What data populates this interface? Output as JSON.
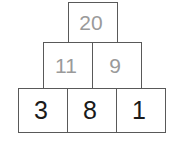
{
  "figure": {
    "kind": "number-pyramid",
    "rows": [
      {
        "row_index": 0,
        "cells": [
          {
            "value": "20",
            "style": "derived"
          }
        ]
      },
      {
        "row_index": 1,
        "cells": [
          {
            "value": "11",
            "style": "derived"
          },
          {
            "value": "9",
            "style": "derived"
          }
        ]
      },
      {
        "row_index": 2,
        "cells": [
          {
            "value": "3",
            "style": "given"
          },
          {
            "value": "8",
            "style": "given"
          },
          {
            "value": "1",
            "style": "given"
          }
        ]
      }
    ],
    "colors": {
      "border": "#595959",
      "derived_text": "#9a9a9a",
      "given_text": "#1a1a1a",
      "background": "#ffffff"
    }
  }
}
